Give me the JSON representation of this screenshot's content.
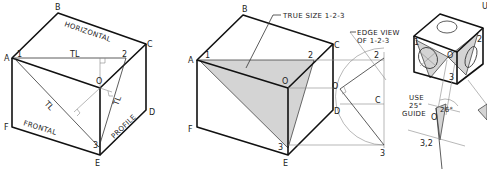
{
  "figure_left": {
    "vertex_labels": {
      "A": "A",
      "B": "B",
      "C": "C",
      "D": "D",
      "E": "E",
      "F": "F",
      "O": "O"
    },
    "point_labels": {
      "p1": "1",
      "p2": "2",
      "p3": "3"
    },
    "face_labels": {
      "horizontal": "HORIZONTAL",
      "frontal": "FRONTAL",
      "profile": "PROFILE"
    },
    "true_length_label": "TL"
  },
  "figure_middle": {
    "vertex_labels": {
      "A": "A",
      "B": "B",
      "C": "C",
      "D": "D",
      "E": "E",
      "F": "F",
      "O": "O"
    },
    "point_labels": {
      "p1": "1",
      "p2": "2",
      "p3": "3"
    },
    "callout_true_size": "TRUE SIZE 1-2-3",
    "callout_edge_view_line1": "EDGE VIEW",
    "callout_edge_view_line2": "OF 1-2-3",
    "projection_labels": {
      "p2": "2",
      "O": "O",
      "C": "C",
      "D": "D",
      "p3": "3"
    }
  },
  "figure_right": {
    "point_labels": {
      "p1": "1",
      "p2": "2",
      "p3": "3",
      "O": "O"
    },
    "guide_line1": "USE",
    "guide_line2": "25°",
    "guide_line3": "GUIDE",
    "angle_label": "26°",
    "edge_label": "3,2",
    "origin_label": "O",
    "top_right_fragment": "U"
  }
}
